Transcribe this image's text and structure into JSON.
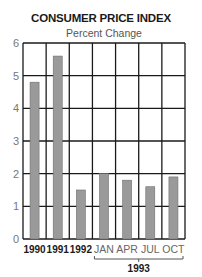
{
  "title": "CONSUMER PRICE INDEX",
  "subtitle": "Percent Change",
  "colors": {
    "bar": "#9a9a9a",
    "bar_edge": "#6e6e6e",
    "grid": "#1a1a1a",
    "tick_label": "#777777",
    "category_label_bold": "#1a1a1a",
    "category_label_light": "#666666"
  },
  "chart_data": {
    "type": "bar",
    "title": "CONSUMER PRICE INDEX",
    "subtitle": "Percent Change",
    "xlabel": "",
    "ylabel": "",
    "categories": [
      "1990",
      "1991",
      "1992",
      "JAN",
      "APR",
      "JUL",
      "OCT"
    ],
    "category_groups": [
      {
        "label": "1993",
        "members": [
          "JAN",
          "APR",
          "JUL",
          "OCT"
        ]
      }
    ],
    "values": [
      4.8,
      5.6,
      1.5,
      2.0,
      1.8,
      1.6,
      1.9
    ],
    "ylim": [
      0,
      6
    ],
    "yticks": [
      0,
      1,
      2,
      3,
      4,
      5,
      6
    ],
    "grid": true,
    "legend": null
  }
}
